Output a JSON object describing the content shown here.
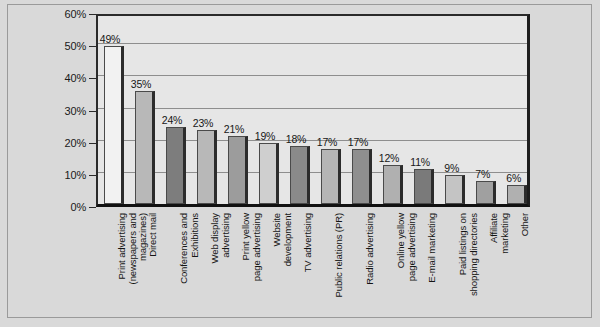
{
  "chart_data": {
    "type": "bar",
    "title": "",
    "subtitle": "",
    "xlabel": "",
    "ylabel": "",
    "ylim": [
      0,
      60
    ],
    "ytick_values": [
      0,
      10,
      20,
      30,
      40,
      50,
      60
    ],
    "ytick_labels": [
      "0%",
      "10%",
      "20%",
      "30%",
      "40%",
      "50%",
      "60%"
    ],
    "grid": true,
    "legend": false,
    "value_suffix": "%",
    "categories": [
      "Print advertising\n(newspapers and\nmagazines)",
      "Direct mail",
      "Conferences and\nExhibitions",
      "Web display\nadvertising",
      "Print yellow\npage advertising",
      "Website\ndevelopment",
      "TV advertising",
      "Public relations (PR)",
      "Radio advertising",
      "Online yellow\npage advertising",
      "E-mail marketing",
      "Paid listings on\nshopping directories",
      "Affiliate\nmarketing",
      "Other"
    ],
    "values": [
      49,
      35,
      24,
      23,
      21,
      19,
      18,
      17,
      17,
      12,
      11,
      9,
      7,
      6
    ],
    "value_labels": [
      "49%",
      "35%",
      "24%",
      "23%",
      "21%",
      "19%",
      "18%",
      "17%",
      "17%",
      "12%",
      "11%",
      "9%",
      "7%",
      "6%"
    ],
    "bar_colors": [
      "#f2f2f2",
      "#b8b8b8",
      "#7d7d7d",
      "#b8b8b8",
      "#9c9c9c",
      "#cfcfcf",
      "#8a8a8a",
      "#b5b5b5",
      "#8f8f8f",
      "#b0b0b0",
      "#7a7a7a",
      "#c4c4c4",
      "#a0a0a0",
      "#b0b0b0"
    ]
  },
  "colors": {
    "page_background": "#d9d9d9",
    "plot_background": "#e6e6e6",
    "gridline": "#8e8e8e",
    "axis": "#1d1d1d",
    "text": "#161616"
  }
}
